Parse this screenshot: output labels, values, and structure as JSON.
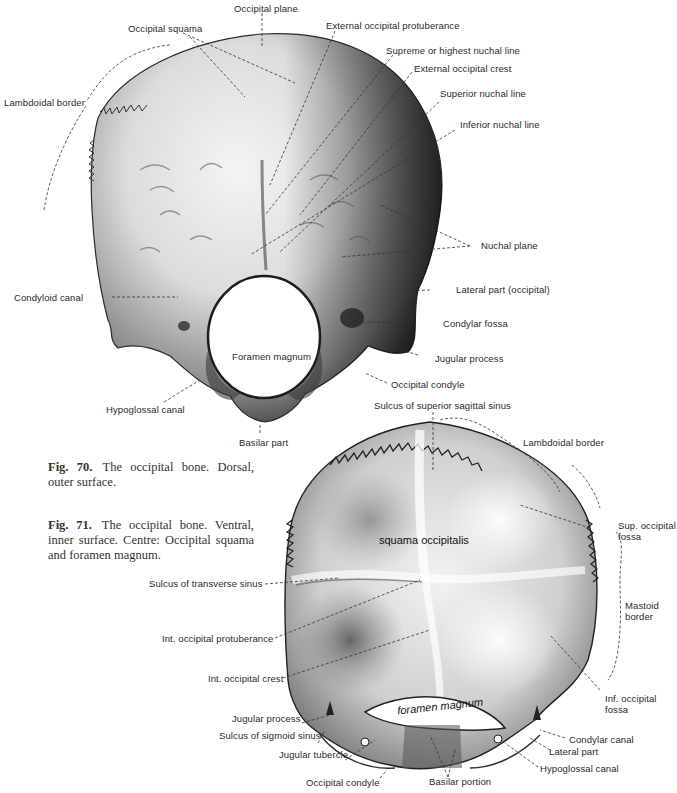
{
  "figure_70": {
    "caption_number": "Fig. 70.",
    "caption_text": "The occipital bone. Dorsal, outer surface.",
    "labels": {
      "occipital_plane": "Occipital plane",
      "occipital_squama": "Occipital squama",
      "external_occipital_protuberance": "External occipital protuberance",
      "supreme_nuchal_line": "Supreme or highest nuchal line",
      "external_occipital_crest": "External occipital crest",
      "superior_nuchal_line": "Superior nuchal line",
      "inferior_nuchal_line": "Inferior nuchal line",
      "lambdoidal_border": "Lambdoidal border",
      "nuchal_plane": "Nuchal plane",
      "lateral_part": "Lateral part (occipital)",
      "condyloid_canal": "Condyloid canal",
      "condylar_fossa": "Condylar fossa",
      "foramen_magnum": "Foramen magnum",
      "jugular_process": "Jugular process",
      "occipital_condyle": "Occipital condyle",
      "hypoglossal_canal": "Hypoglossal canal",
      "basilar_part": "Basilar part"
    }
  },
  "figure_71": {
    "caption_number": "Fig. 71.",
    "caption_text": "The occipital bone. Ventral, inner surface. Centre: Occipital squama and foramen magnum.",
    "inscriptions": {
      "squama": "squama occipitalis",
      "foramen": "foramen magnum"
    },
    "labels": {
      "sulcus_superior_sagittal_sinus": "Sulcus of superior sagittal sinus",
      "lambdoidal_border": "Lambdoidal border",
      "sup_occipital_fossa_1": "Sup. occipital",
      "sup_occipital_fossa_2": "fossa",
      "mastoid_border_1": "Mastoid",
      "mastoid_border_2": "border",
      "sulcus_transverse_sinus": "Sulcus of transverse sinus",
      "int_occipital_protuberance": "Int. occipital protuberance",
      "int_occipital_crest": "Int. occipital crest",
      "inf_occipital_fossa_1": "Inf. occipital",
      "inf_occipital_fossa_2": "fossa",
      "jugular_process": "Jugular process",
      "sulcus_sigmoid_sinus": "Sulcus of sigmoid sinus",
      "jugular_tubercle": "Jugular tubercle",
      "occipital_condyle": "Occipital condyle",
      "basilar_portion": "Basilar portion",
      "condylar_canal": "Condylar canal",
      "lateral_part": "Lateral part",
      "hypoglossal_canal": "Hypoglossal canal"
    }
  }
}
